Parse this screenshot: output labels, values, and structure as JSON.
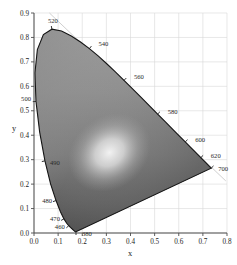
{
  "figure": {
    "name": "cie-1931-chromaticity-diagram",
    "background_color": "#ffffff",
    "grid_color": "#d8d8d8",
    "axis_color": "#555555",
    "locus_color": "#1a1a1a",
    "guide_line_color": "#c9c9c9"
  },
  "chart_data": {
    "type": "scatter",
    "title": "",
    "subtitle": "",
    "xlabel": "x",
    "ylabel": "y",
    "xlim": [
      0.0,
      0.8
    ],
    "ylim": [
      0.0,
      0.9
    ],
    "grid": true,
    "legend": "none",
    "xticks": [
      "0.0",
      "0.1",
      "0.2",
      "0.3",
      "0.4",
      "0.5",
      "0.6",
      "0.7",
      "0.8"
    ],
    "xtick_values": [
      0.0,
      0.1,
      0.2,
      0.3,
      0.4,
      0.5,
      0.6,
      0.7,
      0.8
    ],
    "yticks": [
      "0.0",
      "0.1",
      "0.2",
      "0.3",
      "0.4",
      "0.5",
      "0.6",
      "0.7",
      "0.8",
      "0.9"
    ],
    "ytick_values": [
      0.0,
      0.1,
      0.2,
      0.3,
      0.4,
      0.5,
      0.6,
      0.7,
      0.8,
      0.9
    ],
    "annotations": [
      {
        "label": "520",
        "x": 0.0743,
        "y": 0.8338
      },
      {
        "label": "540",
        "x": 0.2296,
        "y": 0.7543
      },
      {
        "label": "560",
        "x": 0.3731,
        "y": 0.6245
      },
      {
        "label": "580",
        "x": 0.5125,
        "y": 0.4866
      },
      {
        "label": "600",
        "x": 0.627,
        "y": 0.3725
      },
      {
        "label": "620",
        "x": 0.6915,
        "y": 0.3083
      },
      {
        "label": "700",
        "x": 0.7347,
        "y": 0.2653
      },
      {
        "label": "500",
        "x": 0.0082,
        "y": 0.5384
      },
      {
        "label": "490",
        "x": 0.0454,
        "y": 0.295
      },
      {
        "label": "480",
        "x": 0.0913,
        "y": 0.1327
      },
      {
        "label": "470",
        "x": 0.1241,
        "y": 0.0578
      },
      {
        "label": "460",
        "x": 0.144,
        "y": 0.0297
      },
      {
        "label": "380",
        "x": 0.1741,
        "y": 0.005
      }
    ],
    "series": [
      {
        "name": "spectral-locus",
        "description": "CIE 1931 2-degree observer spectral locus, 380-700 nm",
        "x": [
          0.1741,
          0.174,
          0.1738,
          0.1736,
          0.1733,
          0.173,
          0.1726,
          0.1721,
          0.1714,
          0.1703,
          0.1689,
          0.1669,
          0.1644,
          0.1611,
          0.1566,
          0.151,
          0.144,
          0.1355,
          0.1241,
          0.1096,
          0.0913,
          0.0687,
          0.0454,
          0.0235,
          0.0082,
          0.0039,
          0.0139,
          0.0389,
          0.0743,
          0.1142,
          0.1547,
          0.1929,
          0.2296,
          0.2658,
          0.3016,
          0.3373,
          0.3731,
          0.4087,
          0.4441,
          0.4788,
          0.5125,
          0.5448,
          0.5752,
          0.6029,
          0.627,
          0.6482,
          0.6658,
          0.6801,
          0.6915,
          0.7006,
          0.7079,
          0.714,
          0.719,
          0.723,
          0.726,
          0.7283,
          0.73,
          0.7311,
          0.732,
          0.7327,
          0.7334,
          0.734,
          0.7344,
          0.7346,
          0.7347,
          0.7347
        ],
        "y": [
          0.005,
          0.005,
          0.0049,
          0.0049,
          0.0048,
          0.0048,
          0.0048,
          0.0048,
          0.0051,
          0.0058,
          0.0069,
          0.0086,
          0.0109,
          0.0138,
          0.0177,
          0.0227,
          0.0297,
          0.0399,
          0.0578,
          0.0868,
          0.1327,
          0.2007,
          0.295,
          0.4127,
          0.5384,
          0.6548,
          0.7502,
          0.812,
          0.8338,
          0.8262,
          0.8059,
          0.7816,
          0.7543,
          0.7243,
          0.6923,
          0.6589,
          0.6245,
          0.5896,
          0.5547,
          0.5202,
          0.4866,
          0.4544,
          0.4242,
          0.3965,
          0.3725,
          0.3514,
          0.334,
          0.3197,
          0.3083,
          0.2993,
          0.292,
          0.2859,
          0.2809,
          0.277,
          0.274,
          0.2717,
          0.27,
          0.2689,
          0.268,
          0.2673,
          0.2666,
          0.266,
          0.2656,
          0.2654,
          0.2653,
          0.2653
        ]
      },
      {
        "name": "purple-line",
        "description": "Line of purples connecting 380 nm to 700 nm",
        "x": [
          0.1741,
          0.7347
        ],
        "y": [
          0.005,
          0.2653
        ]
      },
      {
        "name": "white-point",
        "description": "Brightest region of the gamut shading",
        "x": [
          0.3127
        ],
        "y": [
          0.329
        ]
      },
      {
        "name": "guide-line",
        "description": "Faint straight guide line crossing the upper diagram from the 520 region toward lower right past 700",
        "x": [
          0.064,
          0.795
        ],
        "y": [
          0.9,
          0.213
        ]
      }
    ],
    "tick_wavelengths_nm": [
      380,
      460,
      470,
      480,
      490,
      500,
      520,
      540,
      560,
      580,
      600,
      620,
      700
    ]
  },
  "axes": {
    "x_label": "x",
    "y_label": "y"
  }
}
